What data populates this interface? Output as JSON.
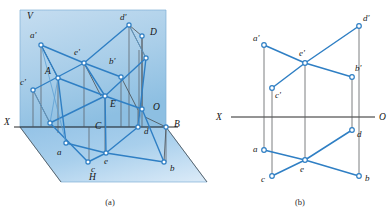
{
  "figure": {
    "title_a": "(a)",
    "title_b": "(b)",
    "colors": {
      "line_blue": "#2f7fc4",
      "line_dark": "#3a3a3a",
      "node_fill": "#ffffff",
      "node_stroke": "#2f7fc4",
      "plane_v_top": "#bcd9ef",
      "plane_v_bottom": "#9cc6e6",
      "plane_h_top": "#9fc9e8",
      "plane_h_bottom": "#cfe4f4",
      "axis_black": "#111111",
      "page_bg": "#ffffff"
    },
    "caption_a_x": 110,
    "caption_a_y": 203,
    "caption_b_x": 300,
    "caption_b_y": 203
  },
  "panel_a": {
    "name": "pictorial-projection-view",
    "plane_labels": [
      {
        "id": "V",
        "text": "V",
        "x": 27,
        "y": 16
      },
      {
        "id": "H",
        "text": "H",
        "x": 89,
        "y": 177
      },
      {
        "id": "X",
        "text": "X",
        "x": 5,
        "y": 122
      },
      {
        "id": "O",
        "text": "O",
        "x": 155,
        "y": 107
      },
      {
        "id": "B",
        "text": "B",
        "x": 176,
        "y": 124
      },
      {
        "id": "D",
        "text": "D",
        "x": 152,
        "y": 32
      }
    ],
    "point_labels": [
      {
        "id": "a-prime",
        "text": "a'",
        "x": 32,
        "y": 37
      },
      {
        "id": "c-prime",
        "text": "c'",
        "x": 22,
        "y": 83
      },
      {
        "id": "e-prime",
        "text": "e'",
        "x": 76,
        "y": 53
      },
      {
        "id": "b-prime",
        "text": "b'",
        "x": 111,
        "y": 62
      },
      {
        "id": "d-prime",
        "text": "d'",
        "x": 122,
        "y": 18
      },
      {
        "id": "A",
        "text": "A",
        "x": 48,
        "y": 71
      },
      {
        "id": "C",
        "text": "C",
        "x": 97,
        "y": 126
      },
      {
        "id": "E",
        "text": "E",
        "x": 112,
        "y": 104
      },
      {
        "id": "a",
        "text": "a",
        "x": 59,
        "y": 152
      },
      {
        "id": "c",
        "text": "c",
        "x": 92,
        "y": 169
      },
      {
        "id": "e",
        "text": "e",
        "x": 105,
        "y": 161
      },
      {
        "id": "d",
        "text": "d",
        "x": 146,
        "y": 131
      },
      {
        "id": "b",
        "text": "b",
        "x": 172,
        "y": 168
      }
    ],
    "vertices_v_plane": {
      "a_prime": [
        41,
        45
      ],
      "c_prime": [
        33,
        90
      ],
      "e_prime": [
        84,
        63
      ],
      "b_prime": [
        121,
        77
      ],
      "d_prime": [
        129,
        25
      ],
      "D_corner": [
        142,
        36
      ],
      "B_corner": [
        166,
        127
      ],
      "O_corner": [
        145,
        117
      ]
    },
    "vertices_space": {
      "A": [
        58,
        78
      ],
      "C": [
        89,
        127
      ],
      "E": [
        105,
        96
      ],
      "B_sp": [
        142,
        109
      ],
      "D_sp": [
        139,
        50
      ]
    },
    "vertices_h_plane": {
      "a": [
        66,
        143
      ],
      "c": [
        88,
        162
      ],
      "e": [
        106,
        153
      ],
      "d": [
        138,
        127
      ],
      "b": [
        164,
        162
      ]
    }
  },
  "panel_b": {
    "name": "orthographic-projection-view",
    "axis": {
      "label_left": "X",
      "label_right": "O",
      "x1": 231,
      "x2": 375,
      "y": 117,
      "label_left_x": 220,
      "label_left_y": 120,
      "label_right_x": 379,
      "label_right_y": 120
    },
    "frontal_points": [
      {
        "id": "a-prime",
        "label": "a'",
        "x": 264,
        "y": 45,
        "lx": 255,
        "ly": 40
      },
      {
        "id": "c-prime",
        "label": "c'",
        "x": 272,
        "y": 88,
        "lx": 276,
        "ly": 96
      },
      {
        "id": "e-prime",
        "label": "e'",
        "x": 305,
        "y": 63,
        "lx": 300,
        "ly": 55
      },
      {
        "id": "b-prime",
        "label": "b'",
        "x": 352,
        "y": 77,
        "lx": 356,
        "ly": 70
      },
      {
        "id": "d-prime",
        "label": "d'",
        "x": 359,
        "y": 26,
        "lx": 364,
        "ly": 21
      }
    ],
    "horizontal_points": [
      {
        "id": "a",
        "label": "a",
        "x": 264,
        "y": 150,
        "lx": 255,
        "ly": 150
      },
      {
        "id": "c",
        "label": "c",
        "x": 272,
        "y": 176,
        "lx": 263,
        "ly": 181
      },
      {
        "id": "e",
        "label": "e",
        "x": 305,
        "y": 160,
        "lx": 301,
        "ly": 170
      },
      {
        "id": "b",
        "label": "b",
        "x": 359,
        "y": 176,
        "lx": 366,
        "ly": 180
      },
      {
        "id": "d",
        "label": "d",
        "x": 352,
        "y": 130,
        "lx": 358,
        "ly": 137
      }
    ],
    "frontal_edges": [
      [
        "a-prime",
        "e-prime"
      ],
      [
        "e-prime",
        "c-prime"
      ],
      [
        "e-prime",
        "b-prime"
      ],
      [
        "e-prime",
        "d-prime"
      ]
    ],
    "horizontal_edges": [
      [
        "a",
        "e"
      ],
      [
        "e",
        "c"
      ],
      [
        "e",
        "b"
      ],
      [
        "e",
        "d"
      ]
    ],
    "projection_lines": [
      {
        "id": "proj-a",
        "x": 264,
        "y1": 45,
        "y2": 150
      },
      {
        "id": "proj-c",
        "x": 272,
        "y1": 88,
        "y2": 176
      },
      {
        "id": "proj-e",
        "x": 305,
        "y1": 63,
        "y2": 160
      },
      {
        "id": "proj-b",
        "x": 352,
        "y1": 77,
        "y2": 130
      },
      {
        "id": "proj-d",
        "x": 359,
        "y1": 26,
        "y2": 176
      }
    ]
  }
}
